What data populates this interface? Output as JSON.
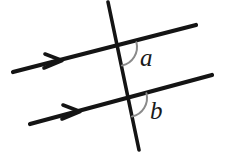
{
  "figure": {
    "background_color": "#ffffff",
    "width": 225,
    "height": 156
  },
  "style": {
    "line_color": "#141414",
    "arc_color": "#8a8a8a",
    "label_color": "#1a1a1a",
    "line_width": 4.2,
    "transversal_width": 3.6,
    "arc_width": 2.0
  },
  "labels": {
    "angle_a": "a",
    "angle_b": "b"
  },
  "geometry": {
    "parallel_line_upper": {
      "name": "upper-parallel-line",
      "x1": 13,
      "y1": 72,
      "x2": 196,
      "y2": 25,
      "arrow_marker_at": {
        "x": 57,
        "y": 61
      }
    },
    "parallel_line_lower": {
      "name": "lower-parallel-line",
      "x1": 30,
      "y1": 124,
      "x2": 212,
      "y2": 75,
      "arrow_marker_at": {
        "x": 75,
        "y": 112
      }
    },
    "transversal": {
      "name": "transversal-line",
      "x1": 108,
      "y1": 2,
      "x2": 139,
      "y2": 150
    },
    "intersection_upper": {
      "x": 118,
      "y": 47
    },
    "intersection_lower": {
      "x": 128,
      "y": 98
    },
    "arc_a": {
      "center_x": 118,
      "center_y": 47,
      "radius": 19,
      "start_x": 122.9,
      "start_y": 65.4,
      "end_x": 136.4,
      "end_y": 42.3
    },
    "arc_b": {
      "center_x": 128,
      "center_y": 98,
      "radius": 19,
      "start_x": 132.9,
      "start_y": 116.4,
      "end_x": 146.4,
      "end_y": 93.3
    },
    "label_a_pos": {
      "x": 140,
      "y": 65
    },
    "label_b_pos": {
      "x": 150,
      "y": 118
    }
  }
}
